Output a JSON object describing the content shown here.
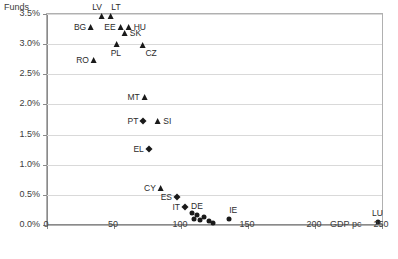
{
  "chart_data": {
    "type": "scatter",
    "title": "",
    "ylabel": "Funds",
    "xlabel": "GDP pc",
    "xlim": [
      0,
      250
    ],
    "ylim": [
      0,
      3.5
    ],
    "grid": true,
    "legend": "none",
    "xticks": [
      {
        "value": 0,
        "label": "0"
      },
      {
        "value": 50,
        "label": "50"
      },
      {
        "value": 100,
        "label": "100"
      },
      {
        "value": 150,
        "label": "150"
      },
      {
        "value": 200,
        "label": "200"
      },
      {
        "value": 250,
        "label": "250"
      }
    ],
    "yticks": [
      {
        "value": 0.0,
        "label": "0.0%"
      },
      {
        "value": 0.5,
        "label": "0.5%"
      },
      {
        "value": 1.0,
        "label": "1.0%"
      },
      {
        "value": 1.5,
        "label": "1.5%"
      },
      {
        "value": 2.0,
        "label": "2.0%"
      },
      {
        "value": 2.5,
        "label": "2.5%"
      },
      {
        "value": 3.0,
        "label": "3.0%"
      },
      {
        "value": 3.5,
        "label": "3.5%"
      }
    ],
    "points": [
      {
        "label": "LV",
        "x": 41,
        "y": 3.46,
        "marker": "triangle",
        "label_pos": "left-above"
      },
      {
        "label": "LT",
        "x": 48,
        "y": 3.46,
        "marker": "triangle",
        "label_pos": "right-above"
      },
      {
        "label": "BG",
        "x": 33,
        "y": 3.29,
        "marker": "triangle",
        "label_pos": "left"
      },
      {
        "label": "EE",
        "x": 55,
        "y": 3.29,
        "marker": "triangle",
        "label_pos": "left"
      },
      {
        "label": "HU",
        "x": 61,
        "y": 3.29,
        "marker": "triangle",
        "label_pos": "right"
      },
      {
        "label": "SK",
        "x": 58,
        "y": 3.18,
        "marker": "triangle",
        "label_pos": "right"
      },
      {
        "label": "PL",
        "x": 52,
        "y": 3.01,
        "marker": "triangle",
        "label_pos": "below"
      },
      {
        "label": "CZ",
        "x": 72,
        "y": 2.99,
        "marker": "triangle",
        "label_pos": "right-below"
      },
      {
        "label": "RO",
        "x": 35,
        "y": 2.73,
        "marker": "triangle",
        "label_pos": "left"
      },
      {
        "label": "MT",
        "x": 73,
        "y": 2.13,
        "marker": "triangle",
        "label_pos": "left"
      },
      {
        "label": "PT",
        "x": 72,
        "y": 1.72,
        "marker": "diamond",
        "label_pos": "left"
      },
      {
        "label": "SI",
        "x": 83,
        "y": 1.72,
        "marker": "triangle",
        "label_pos": "right"
      },
      {
        "label": "EL",
        "x": 76,
        "y": 1.26,
        "marker": "diamond",
        "label_pos": "left"
      },
      {
        "label": "CY",
        "x": 85,
        "y": 0.62,
        "marker": "triangle",
        "label_pos": "left"
      },
      {
        "label": "ES",
        "x": 97,
        "y": 0.46,
        "marker": "diamond",
        "label_pos": "left"
      },
      {
        "label": "IT",
        "x": 103,
        "y": 0.3,
        "marker": "diamond",
        "label_pos": "left"
      },
      {
        "label": "DE",
        "x": 112,
        "y": 0.17,
        "marker": "circle",
        "label_pos": "above"
      },
      {
        "label": "",
        "x": 108,
        "y": 0.2,
        "marker": "circle",
        "label_pos": "none"
      },
      {
        "label": "",
        "x": 110,
        "y": 0.1,
        "marker": "circle",
        "label_pos": "none"
      },
      {
        "label": "",
        "x": 114,
        "y": 0.08,
        "marker": "circle",
        "label_pos": "none"
      },
      {
        "label": "",
        "x": 117,
        "y": 0.14,
        "marker": "circle",
        "label_pos": "none"
      },
      {
        "label": "",
        "x": 121,
        "y": 0.07,
        "marker": "circle",
        "label_pos": "none"
      },
      {
        "label": "",
        "x": 124,
        "y": 0.04,
        "marker": "circle",
        "label_pos": "none"
      },
      {
        "label": "IE",
        "x": 136,
        "y": 0.1,
        "marker": "circle",
        "label_pos": "right-above"
      },
      {
        "label": "LU",
        "x": 247,
        "y": 0.05,
        "marker": "circle",
        "label_pos": "above"
      }
    ]
  },
  "colors": {
    "marker": "#1a1a1a",
    "grid": "#d9d9d9",
    "axis": "#8a8a8a",
    "text": "#3b3b3b"
  }
}
